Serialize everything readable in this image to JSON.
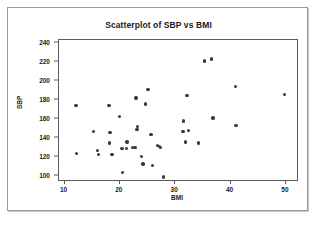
{
  "chart_data": {
    "type": "scatter",
    "title": "Scatterplot of SBP vs BMI",
    "xlabel": "BMI",
    "ylabel": "SBP",
    "xlim": [
      9,
      52
    ],
    "ylim": [
      96,
      243
    ],
    "xticks": [
      10,
      20,
      30,
      40,
      50
    ],
    "yticks": [
      100,
      120,
      140,
      160,
      180,
      200,
      220,
      240
    ],
    "grid": false,
    "legend": null,
    "marker": "filled-circle",
    "marker_color": "#3a3a3a",
    "points": [
      {
        "x": 12.1,
        "y": 174
      },
      {
        "x": 12.2,
        "y": 124
      },
      {
        "x": 15.2,
        "y": 147
      },
      {
        "x": 16.0,
        "y": 127
      },
      {
        "x": 16.1,
        "y": 123
      },
      {
        "x": 18.0,
        "y": 174
      },
      {
        "x": 18.2,
        "y": 146
      },
      {
        "x": 18.1,
        "y": 135
      },
      {
        "x": 18.6,
        "y": 123
      },
      {
        "x": 19.9,
        "y": 163
      },
      {
        "x": 20.4,
        "y": 129
      },
      {
        "x": 20.5,
        "y": 104
      },
      {
        "x": 21.3,
        "y": 136
      },
      {
        "x": 21.2,
        "y": 129
      },
      {
        "x": 22.3,
        "y": 130
      },
      {
        "x": 22.7,
        "y": 130
      },
      {
        "x": 22.9,
        "y": 182
      },
      {
        "x": 23.2,
        "y": 152
      },
      {
        "x": 23.1,
        "y": 149
      },
      {
        "x": 23.9,
        "y": 121
      },
      {
        "x": 24.2,
        "y": 113
      },
      {
        "x": 24.6,
        "y": 176
      },
      {
        "x": 25.1,
        "y": 191
      },
      {
        "x": 25.6,
        "y": 144
      },
      {
        "x": 25.9,
        "y": 111
      },
      {
        "x": 26.8,
        "y": 132
      },
      {
        "x": 27.2,
        "y": 131
      },
      {
        "x": 27.3,
        "y": 130
      },
      {
        "x": 27.9,
        "y": 99
      },
      {
        "x": 31.5,
        "y": 158
      },
      {
        "x": 31.4,
        "y": 147
      },
      {
        "x": 31.8,
        "y": 136
      },
      {
        "x": 32.1,
        "y": 185
      },
      {
        "x": 32.4,
        "y": 148
      },
      {
        "x": 34.2,
        "y": 135
      },
      {
        "x": 35.3,
        "y": 221
      },
      {
        "x": 36.6,
        "y": 223
      },
      {
        "x": 36.8,
        "y": 161
      },
      {
        "x": 40.9,
        "y": 194
      },
      {
        "x": 41.0,
        "y": 153
      },
      {
        "x": 49.7,
        "y": 186
      }
    ],
    "point_count": 42
  }
}
